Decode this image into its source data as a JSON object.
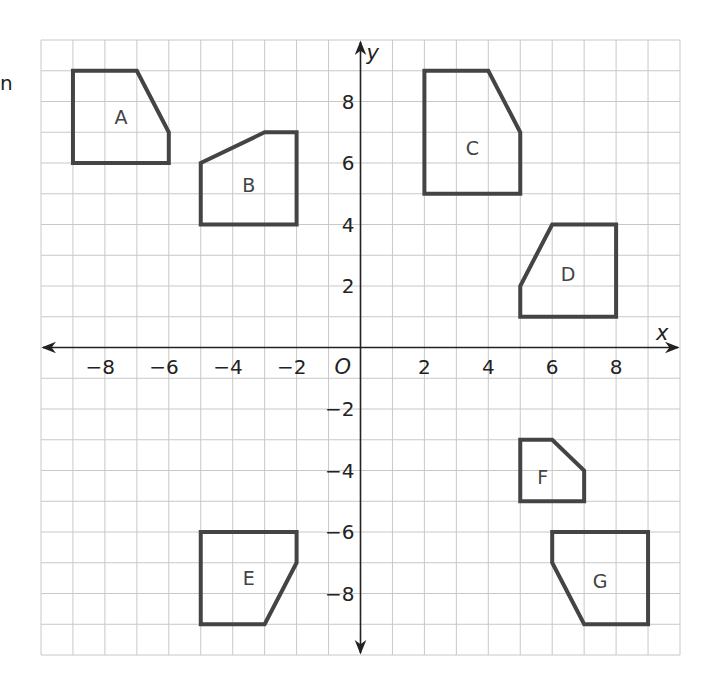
{
  "stray_text": "n",
  "plane": {
    "x_axis_label": "x",
    "y_axis_label": "y",
    "origin_label": "O",
    "x_range": [
      -10,
      10
    ],
    "y_range": [
      -10,
      10
    ],
    "grid_step": 1,
    "x_ticks": [
      {
        "value": -8,
        "label": "−8"
      },
      {
        "value": -6,
        "label": "−6"
      },
      {
        "value": -4,
        "label": "−4"
      },
      {
        "value": -2,
        "label": "−2"
      },
      {
        "value": 2,
        "label": "2"
      },
      {
        "value": 4,
        "label": "4"
      },
      {
        "value": 6,
        "label": "6"
      },
      {
        "value": 8,
        "label": "8"
      }
    ],
    "y_ticks": [
      {
        "value": 8,
        "label": "8"
      },
      {
        "value": 6,
        "label": "6"
      },
      {
        "value": 4,
        "label": "4"
      },
      {
        "value": 2,
        "label": "2"
      },
      {
        "value": -2,
        "label": "−2"
      },
      {
        "value": -4,
        "label": "−4"
      },
      {
        "value": -6,
        "label": "−6"
      },
      {
        "value": -8,
        "label": "−8"
      }
    ]
  },
  "shapes": [
    {
      "label": "A",
      "vertices": [
        [
          -9,
          6
        ],
        [
          -9,
          9
        ],
        [
          -7,
          9
        ],
        [
          -6,
          7
        ],
        [
          -6,
          6
        ]
      ],
      "label_pos": [
        -7.5,
        7.5
      ]
    },
    {
      "label": "B",
      "vertices": [
        [
          -5,
          4
        ],
        [
          -5,
          6
        ],
        [
          -3,
          7
        ],
        [
          -2,
          7
        ],
        [
          -2,
          4
        ]
      ],
      "label_pos": [
        -3.5,
        5.3
      ]
    },
    {
      "label": "C",
      "vertices": [
        [
          2,
          5
        ],
        [
          2,
          9
        ],
        [
          4,
          9
        ],
        [
          5,
          7
        ],
        [
          5,
          5
        ]
      ],
      "label_pos": [
        3.5,
        6.5
      ]
    },
    {
      "label": "D",
      "vertices": [
        [
          5,
          1
        ],
        [
          5,
          2
        ],
        [
          6,
          4
        ],
        [
          8,
          4
        ],
        [
          8,
          1
        ]
      ],
      "label_pos": [
        6.5,
        2.4
      ]
    },
    {
      "label": "E",
      "vertices": [
        [
          -5,
          -6
        ],
        [
          -2,
          -6
        ],
        [
          -2,
          -7
        ],
        [
          -3,
          -9
        ],
        [
          -5,
          -9
        ]
      ],
      "label_pos": [
        -3.5,
        -7.5
      ]
    },
    {
      "label": "F",
      "vertices": [
        [
          5,
          -3
        ],
        [
          6,
          -3
        ],
        [
          7,
          -4
        ],
        [
          7,
          -5
        ],
        [
          5,
          -5
        ]
      ],
      "label_pos": [
        5.7,
        -4.2
      ]
    },
    {
      "label": "G",
      "vertices": [
        [
          6,
          -6
        ],
        [
          6,
          -7
        ],
        [
          7,
          -9
        ],
        [
          9,
          -9
        ],
        [
          9,
          -6
        ]
      ],
      "label_pos": [
        7.5,
        -7.6
      ]
    }
  ],
  "colors": {
    "grid": "#c8c8c8",
    "axis": "#222222",
    "shape_stroke": "#444444"
  }
}
